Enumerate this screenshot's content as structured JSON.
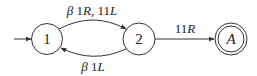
{
  "diagram": {
    "type": "state-machine",
    "states": [
      {
        "id": "1",
        "label": "1",
        "initial": true,
        "accepting": false
      },
      {
        "id": "2",
        "label": "2",
        "initial": false,
        "accepting": false
      },
      {
        "id": "A",
        "label": "A",
        "initial": false,
        "accepting": true
      }
    ],
    "transitions": [
      {
        "from": "1",
        "to": "2",
        "label": "β1R, 11L"
      },
      {
        "from": "2",
        "to": "1",
        "label": "β1L"
      },
      {
        "from": "2",
        "to": "A",
        "label": "11R"
      }
    ],
    "labels": {
      "t12_beta": "β",
      "t12_rest": " 1",
      "t12_r": "R",
      "t12_comma": ", 11",
      "t12_l": "L",
      "t21_beta": "β",
      "t21_rest": " 1",
      "t21_l": "L",
      "t2a_num": "11",
      "t2a_r": "R"
    },
    "colors": {
      "stroke": "#333333",
      "text": "#222222",
      "background": "#ffffff"
    }
  }
}
